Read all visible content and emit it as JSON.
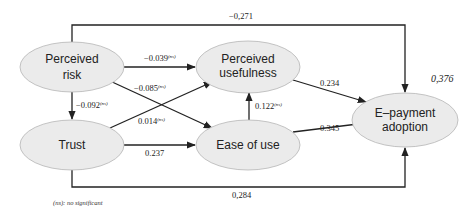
{
  "diagram": {
    "type": "structural-equation-model",
    "nodes": [
      {
        "id": "risk",
        "label_line1": "Perceived",
        "label_line2": "risk"
      },
      {
        "id": "trust",
        "label_line1": "Trust"
      },
      {
        "id": "usefulness",
        "label_line1": "Perceived",
        "label_line2": "usefulness"
      },
      {
        "id": "ease",
        "label_line1": "Ease of use"
      },
      {
        "id": "adoption",
        "label_line1": "E–payment",
        "label_line2": "adoption",
        "r_squared": "0,376"
      }
    ],
    "edges": [
      {
        "from": "risk",
        "to": "adoption",
        "coef": "−0,271",
        "sig": ""
      },
      {
        "from": "risk",
        "to": "usefulness",
        "coef": "−0.039",
        "sig": "(ns)"
      },
      {
        "from": "risk",
        "to": "ease",
        "coef": "−0.085",
        "sig": "(ns)"
      },
      {
        "from": "risk",
        "to": "trust",
        "coef": "−0.092",
        "sig": "(ns)"
      },
      {
        "from": "trust",
        "to": "usefulness",
        "coef": "0.014",
        "sig": "(ns)"
      },
      {
        "from": "trust",
        "to": "ease",
        "coef": "0.237",
        "sig": ""
      },
      {
        "from": "trust",
        "to": "adoption",
        "coef": "0,284",
        "sig": ""
      },
      {
        "from": "ease",
        "to": "usefulness",
        "coef": "0.122",
        "sig": "(ns)"
      },
      {
        "from": "usefulness",
        "to": "adoption",
        "coef": "0.234",
        "sig": ""
      },
      {
        "from": "ease",
        "to": "adoption",
        "coef": "0.345",
        "sig": ""
      }
    ],
    "note": "(ns): no significant"
  }
}
